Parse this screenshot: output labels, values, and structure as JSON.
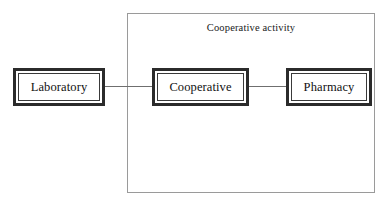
{
  "diagram": {
    "group": {
      "label": "Cooperative activity",
      "border_color": "#9a9a9a"
    },
    "nodes": [
      {
        "id": "laboratory",
        "label": "Laboratory"
      },
      {
        "id": "cooperative",
        "label": "Cooperative"
      },
      {
        "id": "pharmacy",
        "label": "Pharmacy"
      }
    ],
    "connectors": [
      {
        "id": "lab-coop",
        "from": "Laboratory",
        "to": "Cooperative"
      },
      {
        "id": "coop-pharm",
        "from": "Cooperative",
        "to": "Pharmacy"
      }
    ],
    "colors": {
      "node_border": "#2b2b2b",
      "node_inner_border": "#3a3a3a",
      "connector": "#6f6f6f",
      "text": "#111111",
      "background": "#ffffff"
    }
  }
}
